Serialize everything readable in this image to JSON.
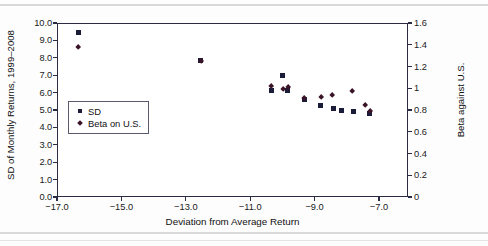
{
  "chart_data": {
    "type": "scatter",
    "title": "",
    "xlabel": "Deviation from Average Return",
    "ylabel": "SD of Monthly Returns, 1999–2008",
    "y2label": "Beta against U.S.",
    "xlim": [
      -17.0,
      -6.1
    ],
    "ylim": [
      0.0,
      10.0
    ],
    "y2lim": [
      0,
      1.6
    ],
    "grid": false,
    "legend_position": "inside-left",
    "xticks": [
      "−17.0",
      "−15.0",
      "−13.0",
      "−11.0",
      "−9.0",
      "−7.0"
    ],
    "xtick_values": [
      -17.0,
      -15.0,
      -13.0,
      -11.0,
      -9.0,
      -7.0
    ],
    "yticks": [
      "0.0",
      "1.0",
      "2.0",
      "3.0",
      "4.0",
      "5.0",
      "6.0",
      "7.0",
      "8.0",
      "9.0",
      "10.0"
    ],
    "ytick_values": [
      0.0,
      1.0,
      2.0,
      3.0,
      4.0,
      5.0,
      6.0,
      7.0,
      8.0,
      9.0,
      10.0
    ],
    "y2ticks": [
      "0",
      "0.2",
      "0.4",
      "0.6",
      "0.8",
      "1",
      "1.2",
      "1.4",
      "1.6"
    ],
    "y2tick_values": [
      0,
      0.2,
      0.4,
      0.6,
      0.8,
      1.0,
      1.2,
      1.4,
      1.6
    ],
    "series": [
      {
        "name": "SD",
        "marker": "square",
        "color": "#1b1b3a",
        "axis": "left",
        "points": [
          {
            "x": -16.37,
            "y": 9.5
          },
          {
            "x": -12.56,
            "y": 7.9
          },
          {
            "x": -10.02,
            "y": 7.05
          },
          {
            "x": -10.36,
            "y": 6.15
          },
          {
            "x": -9.86,
            "y": 6.2
          },
          {
            "x": -9.36,
            "y": 5.65
          },
          {
            "x": -8.84,
            "y": 5.3
          },
          {
            "x": -8.44,
            "y": 5.15
          },
          {
            "x": -8.2,
            "y": 5.05
          },
          {
            "x": -7.83,
            "y": 5.0
          },
          {
            "x": -7.34,
            "y": 4.83
          }
        ]
      },
      {
        "name": "Beta on U.S.",
        "marker": "diamond",
        "color": "#3a1326",
        "axis": "right",
        "points": [
          {
            "x": -16.37,
            "y": 1.39
          },
          {
            "x": -12.56,
            "y": 1.26
          },
          {
            "x": -10.39,
            "y": 1.03
          },
          {
            "x": -10.02,
            "y": 1.0
          },
          {
            "x": -9.86,
            "y": 1.02
          },
          {
            "x": -9.36,
            "y": 0.92
          },
          {
            "x": -8.84,
            "y": 0.93
          },
          {
            "x": -8.47,
            "y": 0.95
          },
          {
            "x": -7.86,
            "y": 0.98
          },
          {
            "x": -7.46,
            "y": 0.85
          },
          {
            "x": -7.31,
            "y": 0.8
          }
        ]
      }
    ]
  },
  "legend": {
    "items": [
      {
        "label": "SD",
        "marker": "square"
      },
      {
        "label": "Beta on U.S.",
        "marker": "diamond"
      }
    ]
  }
}
